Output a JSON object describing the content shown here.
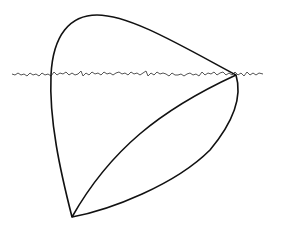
{
  "diagram": {
    "colors": {
      "background": "#ffffff",
      "outline": "#111111",
      "wavy_line": "#555555"
    },
    "shapes": [
      {
        "name": "outer-loop",
        "type": "closed-curve"
      },
      {
        "name": "inner-chord",
        "type": "curve",
        "from": "bottom-vertex",
        "to": "right-vertex"
      },
      {
        "name": "wavy-line",
        "type": "rough-horizontal-line"
      }
    ],
    "labels": []
  }
}
